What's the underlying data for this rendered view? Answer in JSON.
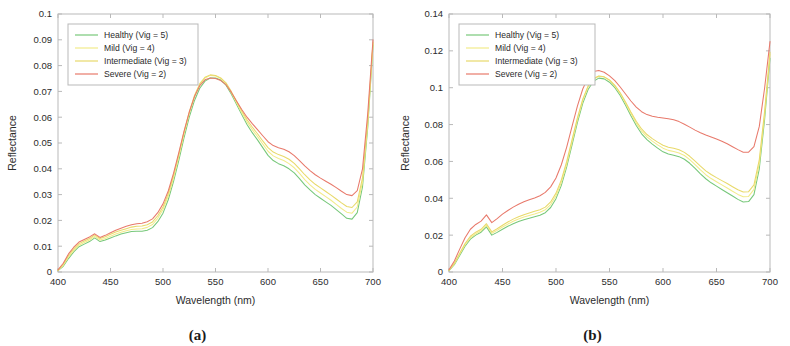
{
  "figure": {
    "panels": [
      {
        "sublabel": "(a)",
        "xlabel": "Wavelength (nm)",
        "ylabel": "Reflectance",
        "xticks": [
          "400",
          "450",
          "500",
          "550",
          "600",
          "650",
          "700"
        ],
        "yticks": [
          "0",
          "0.01",
          "0.02",
          "0.03",
          "0.04",
          "0.05",
          "0.06",
          "0.07",
          "0.08",
          "0.09",
          "0.1"
        ]
      },
      {
        "sublabel": "(b)",
        "xlabel": "Wavelength (nm)",
        "ylabel": "Reflectance",
        "xticks": [
          "400",
          "450",
          "500",
          "550",
          "600",
          "650",
          "700"
        ],
        "yticks": [
          "0",
          "0.02",
          "0.04",
          "0.06",
          "0.08",
          "0.1",
          "0.12",
          "0.14"
        ]
      }
    ],
    "legend": {
      "entries": [
        {
          "label": "Healthy (Vig = 5)",
          "color": "#77c87a"
        },
        {
          "label": "Mild (Vig = 4)",
          "color": "#f2eb8a"
        },
        {
          "label": "Intermediate (Vig = 3)",
          "color": "#e8d96a"
        },
        {
          "label": "Severe (Vig = 2)",
          "color": "#e8796b"
        }
      ]
    }
  },
  "chart_data": [
    {
      "type": "line",
      "title": "(a)",
      "xlabel": "Wavelength (nm)",
      "ylabel": "Reflectance",
      "xlim": [
        400,
        700
      ],
      "ylim": [
        0,
        0.1
      ],
      "xticks": [
        400,
        450,
        500,
        550,
        600,
        650,
        700
      ],
      "yticks": [
        0,
        0.01,
        0.02,
        0.03,
        0.04,
        0.05,
        0.06,
        0.07,
        0.08,
        0.09,
        0.1
      ],
      "grid": false,
      "legend_position": "top-left",
      "x": [
        400,
        405,
        410,
        415,
        420,
        425,
        430,
        435,
        440,
        445,
        450,
        455,
        460,
        465,
        470,
        475,
        480,
        485,
        490,
        495,
        500,
        505,
        510,
        515,
        520,
        525,
        530,
        535,
        540,
        545,
        550,
        555,
        560,
        565,
        570,
        575,
        580,
        585,
        590,
        595,
        600,
        605,
        610,
        615,
        620,
        625,
        630,
        635,
        640,
        645,
        650,
        655,
        660,
        665,
        670,
        675,
        680,
        685,
        690,
        695,
        700
      ],
      "series": [
        {
          "name": "Healthy (Vig = 5)",
          "color": "#77c87a",
          "values": [
            0.0005,
            0.0022,
            0.0052,
            0.0078,
            0.0098,
            0.0108,
            0.0118,
            0.0132,
            0.0118,
            0.0124,
            0.0132,
            0.014,
            0.0147,
            0.0152,
            0.0157,
            0.0158,
            0.0158,
            0.0162,
            0.0172,
            0.0195,
            0.0228,
            0.028,
            0.035,
            0.0432,
            0.052,
            0.06,
            0.0665,
            0.0712,
            0.074,
            0.0752,
            0.0752,
            0.0744,
            0.0724,
            0.069,
            0.065,
            0.061,
            0.0572,
            0.054,
            0.0512,
            0.0482,
            0.0452,
            0.0432,
            0.042,
            0.0412,
            0.04,
            0.0384,
            0.0362,
            0.0338,
            0.0318,
            0.03,
            0.0286,
            0.0272,
            0.0258,
            0.0242,
            0.0225,
            0.0208,
            0.0205,
            0.023,
            0.033,
            0.056,
            0.088
          ]
        },
        {
          "name": "Mild (Vig = 4)",
          "color": "#f2eb8a",
          "values": [
            0.0006,
            0.0026,
            0.0058,
            0.0084,
            0.0104,
            0.0114,
            0.0124,
            0.0138,
            0.0124,
            0.013,
            0.0139,
            0.0147,
            0.0154,
            0.016,
            0.0165,
            0.0167,
            0.0168,
            0.0173,
            0.0184,
            0.0208,
            0.0242,
            0.0294,
            0.0364,
            0.0446,
            0.0534,
            0.0614,
            0.0679,
            0.0726,
            0.0752,
            0.0762,
            0.076,
            0.075,
            0.073,
            0.0696,
            0.0656,
            0.0618,
            0.0582,
            0.0552,
            0.0525,
            0.0496,
            0.0468,
            0.045,
            0.044,
            0.0432,
            0.042,
            0.0404,
            0.0382,
            0.0358,
            0.0338,
            0.032,
            0.0306,
            0.0292,
            0.0278,
            0.0262,
            0.0246,
            0.0232,
            0.0228,
            0.0252,
            0.0348,
            0.0575,
            0.0885
          ]
        },
        {
          "name": "Intermediate (Vig = 3)",
          "color": "#e8d96a",
          "values": [
            0.0007,
            0.003,
            0.0064,
            0.009,
            0.011,
            0.012,
            0.013,
            0.0144,
            0.013,
            0.0137,
            0.0146,
            0.0155,
            0.0162,
            0.0168,
            0.0174,
            0.0177,
            0.0178,
            0.0183,
            0.0194,
            0.0218,
            0.0252,
            0.0304,
            0.0374,
            0.0456,
            0.0542,
            0.062,
            0.0684,
            0.073,
            0.0755,
            0.0764,
            0.0762,
            0.0752,
            0.0733,
            0.07,
            0.0662,
            0.0625,
            0.059,
            0.0562,
            0.0536,
            0.0508,
            0.0482,
            0.0465,
            0.0455,
            0.0448,
            0.0437,
            0.0421,
            0.04,
            0.0377,
            0.0357,
            0.034,
            0.0326,
            0.0312,
            0.0298,
            0.0283,
            0.0268,
            0.0254,
            0.025,
            0.0272,
            0.0365,
            0.0588,
            0.089
          ]
        },
        {
          "name": "Severe (Vig = 2)",
          "color": "#e8796b",
          "values": [
            0.0008,
            0.0034,
            0.007,
            0.0096,
            0.0116,
            0.0126,
            0.0136,
            0.0148,
            0.0134,
            0.0142,
            0.0152,
            0.0162,
            0.017,
            0.0177,
            0.0183,
            0.0187,
            0.0189,
            0.0195,
            0.0206,
            0.023,
            0.0264,
            0.0314,
            0.0382,
            0.0462,
            0.0545,
            0.062,
            0.068,
            0.0722,
            0.0745,
            0.0752,
            0.075,
            0.0742,
            0.0726,
            0.0697,
            0.0663,
            0.063,
            0.06,
            0.0575,
            0.0552,
            0.0528,
            0.0505,
            0.049,
            0.0482,
            0.0476,
            0.0466,
            0.0451,
            0.0432,
            0.0411,
            0.0393,
            0.0377,
            0.0364,
            0.0352,
            0.034,
            0.0327,
            0.0313,
            0.03,
            0.0296,
            0.0315,
            0.04,
            0.0615,
            0.09
          ]
        }
      ]
    },
    {
      "type": "line",
      "title": "(b)",
      "xlabel": "Wavelength (nm)",
      "ylabel": "Reflectance",
      "xlim": [
        400,
        700
      ],
      "ylim": [
        0,
        0.14
      ],
      "xticks": [
        400,
        450,
        500,
        550,
        600,
        650,
        700
      ],
      "yticks": [
        0,
        0.02,
        0.04,
        0.06,
        0.08,
        0.1,
        0.12,
        0.14
      ],
      "grid": false,
      "legend_position": "top-left",
      "x": [
        400,
        405,
        410,
        415,
        420,
        425,
        430,
        435,
        440,
        445,
        450,
        455,
        460,
        465,
        470,
        475,
        480,
        485,
        490,
        495,
        500,
        505,
        510,
        515,
        520,
        525,
        530,
        535,
        540,
        545,
        550,
        555,
        560,
        565,
        570,
        575,
        580,
        585,
        590,
        595,
        600,
        605,
        610,
        615,
        620,
        625,
        630,
        635,
        640,
        645,
        650,
        655,
        660,
        665,
        670,
        675,
        680,
        685,
        690,
        695,
        700
      ],
      "series": [
        {
          "name": "Healthy (Vig = 5)",
          "color": "#77c87a",
          "values": [
            0.0008,
            0.004,
            0.009,
            0.014,
            0.0178,
            0.02,
            0.0216,
            0.0245,
            0.02,
            0.0215,
            0.0232,
            0.0248,
            0.0262,
            0.0274,
            0.0284,
            0.0292,
            0.03,
            0.0308,
            0.0322,
            0.035,
            0.0398,
            0.047,
            0.057,
            0.069,
            0.081,
            0.0915,
            0.099,
            0.1035,
            0.1052,
            0.1048,
            0.103,
            0.1,
            0.0958,
            0.0905,
            0.0848,
            0.0795,
            0.075,
            0.0718,
            0.0694,
            0.0672,
            0.0652,
            0.064,
            0.0634,
            0.0626,
            0.0612,
            0.059,
            0.0562,
            0.0532,
            0.0506,
            0.0484,
            0.0466,
            0.0448,
            0.043,
            0.0412,
            0.0394,
            0.038,
            0.0382,
            0.042,
            0.056,
            0.083,
            0.116
          ]
        },
        {
          "name": "Mild (Vig = 4)",
          "color": "#f2eb8a",
          "values": [
            0.0009,
            0.0044,
            0.0096,
            0.0148,
            0.0186,
            0.0208,
            0.0224,
            0.0254,
            0.021,
            0.0226,
            0.0244,
            0.026,
            0.0275,
            0.0288,
            0.0298,
            0.0307,
            0.0315,
            0.0324,
            0.0338,
            0.0366,
            0.0414,
            0.0486,
            0.0586,
            0.0706,
            0.0826,
            0.093,
            0.1004,
            0.1046,
            0.1062,
            0.1058,
            0.104,
            0.101,
            0.0968,
            0.0916,
            0.086,
            0.0808,
            0.0764,
            0.0733,
            0.071,
            0.069,
            0.0672,
            0.066,
            0.0654,
            0.0646,
            0.0632,
            0.061,
            0.0583,
            0.0554,
            0.0528,
            0.0507,
            0.049,
            0.0473,
            0.0456,
            0.0438,
            0.0421,
            0.0408,
            0.041,
            0.0448,
            0.0588,
            0.0856,
            0.118
          ]
        },
        {
          "name": "Intermediate (Vig = 3)",
          "color": "#e8d96a",
          "values": [
            0.001,
            0.0048,
            0.0102,
            0.0155,
            0.0194,
            0.0216,
            0.0232,
            0.0262,
            0.0218,
            0.0235,
            0.0254,
            0.0271,
            0.0287,
            0.03,
            0.0311,
            0.032,
            0.0329,
            0.0338,
            0.0352,
            0.038,
            0.0428,
            0.05,
            0.06,
            0.0718,
            0.0836,
            0.0938,
            0.101,
            0.105,
            0.1064,
            0.1059,
            0.1042,
            0.1013,
            0.0973,
            0.0922,
            0.0868,
            0.0818,
            0.0776,
            0.0746,
            0.0724,
            0.0705,
            0.0688,
            0.0677,
            0.0671,
            0.0663,
            0.0649,
            0.0628,
            0.0602,
            0.0574,
            0.0549,
            0.0529,
            0.0512,
            0.0496,
            0.048,
            0.0463,
            0.0446,
            0.0434,
            0.0436,
            0.0473,
            0.061,
            0.0874,
            0.1192
          ]
        },
        {
          "name": "Severe (Vig = 2)",
          "color": "#e8796b",
          "values": [
            0.0012,
            0.006,
            0.0124,
            0.0186,
            0.0232,
            0.0258,
            0.0276,
            0.031,
            0.0268,
            0.029,
            0.0314,
            0.0334,
            0.0352,
            0.0368,
            0.0381,
            0.0392,
            0.0402,
            0.0414,
            0.0432,
            0.0462,
            0.051,
            0.0582,
            0.0678,
            0.079,
            0.09,
            0.0993,
            0.1056,
            0.1088,
            0.1094,
            0.1084,
            0.1064,
            0.1038,
            0.1004,
            0.0966,
            0.0928,
            0.0895,
            0.087,
            0.0854,
            0.0845,
            0.084,
            0.0836,
            0.0832,
            0.0826,
            0.0816,
            0.0802,
            0.0786,
            0.077,
            0.0756,
            0.0744,
            0.0733,
            0.0722,
            0.071,
            0.0696,
            0.068,
            0.0664,
            0.065,
            0.065,
            0.068,
            0.079,
            0.1,
            0.125
          ]
        }
      ]
    }
  ]
}
